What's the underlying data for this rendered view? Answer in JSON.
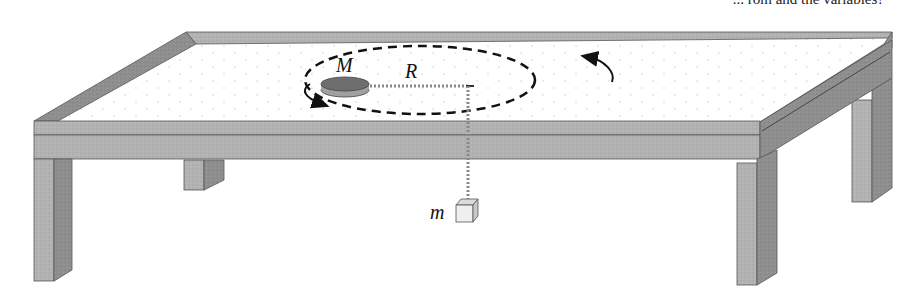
{
  "figure": {
    "type": "physics-diagram",
    "top_cutoff_text": "... rom and the variables?",
    "labels": {
      "puck_mass": "M",
      "radius": "R",
      "hanging_mass": "m"
    },
    "colors": {
      "table_top": "#ffffff",
      "table_edge": "#a9a9a9",
      "table_edge_dark": "#8c8c8c",
      "leg_front": "#b4b4b4",
      "leg_side": "#8e8e8e",
      "puck_top": "#6f6f6f",
      "puck_side": "#9a9a9a",
      "orbit": "#111111",
      "string": "#8a8a8a",
      "block": "#eeeeee"
    },
    "motion": "counter-clockwise arrows indicating circular motion"
  }
}
